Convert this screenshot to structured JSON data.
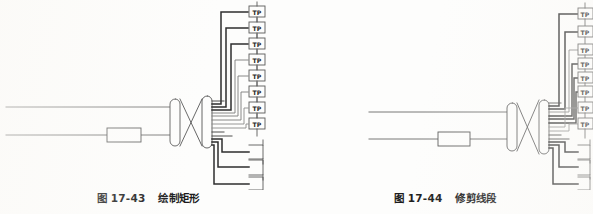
{
  "page": {
    "background_color": "#fdfdfc",
    "ink_color": "#4a4a4a",
    "ink_color_dark": "#2b2b2b",
    "width": 593,
    "height": 214
  },
  "figures": [
    {
      "id": "fig-17-43",
      "caption_number": "图 17-43",
      "caption_title": "绘制矩形",
      "terminal_label": "TP",
      "terminal_count": 8,
      "bracket_count": 3,
      "bus_line_count": 2,
      "connector_symbol": "crossed-connector",
      "has_inline_rectangle": true,
      "terminals": [
        {
          "label": "TP",
          "y": 12
        },
        {
          "label": "TP",
          "y": 28
        },
        {
          "label": "TP",
          "y": 44
        },
        {
          "label": "TP",
          "y": 60
        },
        {
          "label": "TP",
          "y": 76
        },
        {
          "label": "TP",
          "y": 92
        },
        {
          "label": "TP",
          "y": 108
        },
        {
          "label": "TP",
          "y": 124
        }
      ],
      "brackets": [
        {
          "y": 152
        },
        {
          "y": 167
        },
        {
          "y": 184
        }
      ]
    },
    {
      "id": "fig-17-44",
      "caption_number": "图 17-44",
      "caption_title": "修剪线段",
      "terminal_label": "TP",
      "terminal_count": 8,
      "bracket_count": 3,
      "bus_line_count": 2,
      "connector_symbol": "crossed-connector",
      "has_inline_rectangle": true,
      "terminals": [
        {
          "label": "TP",
          "y": 14
        },
        {
          "label": "TP",
          "y": 32
        },
        {
          "label": "TP",
          "y": 50
        },
        {
          "label": "TP",
          "y": 64
        },
        {
          "label": "TP",
          "y": 78
        },
        {
          "label": "TP",
          "y": 92
        },
        {
          "label": "TP",
          "y": 108
        },
        {
          "label": "TP",
          "y": 124
        }
      ],
      "brackets": [
        {
          "y": 152
        },
        {
          "y": 167
        },
        {
          "y": 184
        }
      ]
    }
  ]
}
